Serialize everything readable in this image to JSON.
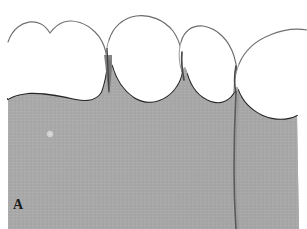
{
  "figure": {
    "panel_label": "A",
    "caption_text": "",
    "width_px": 307,
    "height_px": 229,
    "modality": "clinical-intraoral-photograph",
    "rendering": "grayscale halftone print"
  },
  "colors": {
    "background": "#ffffff",
    "tooth_enamel": "#ffffff",
    "tooth_outline": "#3a3a3a",
    "gingiva_fill": "#a8a8a8",
    "gingiva_fill_light": "#b2b2b2",
    "gingiva_fill_dark": "#9e9e9e",
    "gingival_margin_line": "#2a2a2a",
    "cleft_line": "#4a4a4a",
    "contact_shadow": "#555555",
    "marker_dot": "#d8d8d8",
    "label_text": "#1b1b1b"
  },
  "anatomy": {
    "teeth": [
      {
        "id": "tooth-1",
        "name": "maxillary-central-incisor-left",
        "position": "far-left",
        "incisal_edge": "notched / mamelon-scalloped",
        "visible": "partial, cropped at left border"
      },
      {
        "id": "tooth-2",
        "name": "maxillary-central-incisor-right",
        "position": "center-left",
        "incisal_edge": "rounded-ovoid",
        "visible": "full crown"
      },
      {
        "id": "tooth-3",
        "name": "maxillary-lateral-incisor",
        "position": "center-right",
        "incisal_edge": "rounded",
        "visible": "full crown"
      },
      {
        "id": "tooth-4",
        "name": "maxillary-canine",
        "position": "far-right",
        "incisal_edge": "not visible",
        "visible": "partial, cropped at right border"
      }
    ],
    "gingiva": {
      "description": "scalloped attached gingiva with interdental papillae",
      "papilla_count": 3,
      "texture": "fine horizontal halftone scanlines"
    },
    "findings": [
      {
        "id": "gingival-cleft",
        "label": "",
        "description": "vertical gingival cleft / recession line extending apically from the distal papilla",
        "location": "right-of-center, x approx 236px"
      },
      {
        "id": "marker-dot",
        "label": "",
        "description": "small pale circular reference marker on attached gingiva",
        "location": "x approx 50px, y approx 134px"
      },
      {
        "id": "interdental-contact",
        "label": "",
        "description": "dark interproximal contact shadow between tooth-1 and tooth-2",
        "location": "x approx 106px"
      }
    ]
  }
}
